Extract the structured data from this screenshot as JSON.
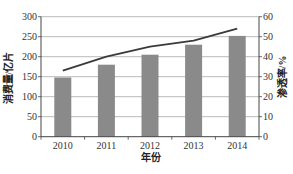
{
  "chart_data": {
    "type": "bar+line",
    "title": "",
    "categories": [
      "2010",
      "2011",
      "2012",
      "2013",
      "2014"
    ],
    "series": [
      {
        "name": "消费量",
        "type": "bar",
        "axis": "left",
        "values": [
          148,
          180,
          205,
          230,
          252
        ],
        "color": "#8a8a8a"
      },
      {
        "name": "渗透率",
        "type": "line",
        "axis": "right",
        "values": [
          33,
          40,
          45,
          48,
          54
        ],
        "color": "#3a3a3a"
      }
    ],
    "xlabel": "年份",
    "ylabel_left": "消费量/亿片",
    "ylabel_right": "渗透率/%",
    "ylim_left": [
      0,
      300
    ],
    "ylim_right": [
      0,
      60
    ],
    "yticks_left": [
      "0",
      "50",
      "100",
      "150",
      "200",
      "250",
      "300"
    ],
    "yticks_right": [
      "0",
      "10",
      "20",
      "30",
      "40",
      "50",
      "60"
    ],
    "grid": true,
    "legend": "none"
  },
  "colors": {
    "grid": "#a8a8a8",
    "axis": "#444444",
    "bar": "#8a8a8a",
    "line": "#3a3a3a"
  }
}
